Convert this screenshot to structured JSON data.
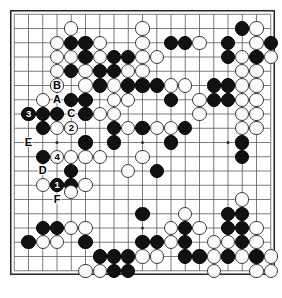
{
  "figure": {
    "kind": "go-board-diagram",
    "board_size": 19,
    "background_color": "#ffffff",
    "line_color": "#5a5a5a",
    "border_color": "#2b2b2b",
    "black_color": "#111111",
    "white_color": "#fbfbfb",
    "geometry": {
      "origin_x": 14.25,
      "origin_y": 14.25,
      "spacing": 14.25,
      "stone_diameter": 14.2
    },
    "star_points": [
      [
        3,
        3
      ],
      [
        9,
        3
      ],
      [
        15,
        3
      ],
      [
        3,
        9
      ],
      [
        9,
        9
      ],
      [
        15,
        9
      ],
      [
        3,
        15
      ],
      [
        9,
        15
      ],
      [
        15,
        15
      ]
    ]
  },
  "stones": {
    "black": [
      [
        4,
        2
      ],
      [
        5,
        2
      ],
      [
        5,
        3
      ],
      [
        7,
        3
      ],
      [
        8,
        3
      ],
      [
        4,
        4
      ],
      [
        6,
        4
      ],
      [
        7,
        4
      ],
      [
        11,
        2
      ],
      [
        12,
        2
      ],
      [
        16,
        1
      ],
      [
        15,
        2
      ],
      [
        18,
        2
      ],
      [
        15,
        3
      ],
      [
        17,
        3
      ],
      [
        6,
        5
      ],
      [
        8,
        5
      ],
      [
        9,
        5
      ],
      [
        10,
        5
      ],
      [
        14,
        5
      ],
      [
        15,
        5
      ],
      [
        4,
        6
      ],
      [
        5,
        6
      ],
      [
        11,
        6
      ],
      [
        14,
        6
      ],
      [
        15,
        6
      ],
      [
        2,
        7
      ],
      [
        3,
        7
      ],
      [
        5,
        7
      ],
      [
        2,
        8
      ],
      [
        7,
        8
      ],
      [
        9,
        8
      ],
      [
        12,
        8
      ],
      [
        5,
        9
      ],
      [
        7,
        9
      ],
      [
        11,
        9
      ],
      [
        16,
        9
      ],
      [
        2,
        10
      ],
      [
        16,
        10
      ],
      [
        4,
        11
      ],
      [
        10,
        11
      ],
      [
        4,
        12
      ],
      [
        9,
        14
      ],
      [
        15,
        14
      ],
      [
        16,
        14
      ],
      [
        2,
        15
      ],
      [
        3,
        15
      ],
      [
        12,
        15
      ],
      [
        15,
        15
      ],
      [
        16,
        15
      ],
      [
        1,
        16
      ],
      [
        5,
        16
      ],
      [
        9,
        16
      ],
      [
        10,
        16
      ],
      [
        12,
        16
      ],
      [
        16,
        16
      ],
      [
        6,
        17
      ],
      [
        7,
        17
      ],
      [
        8,
        17
      ],
      [
        12,
        17
      ],
      [
        13,
        17
      ],
      [
        15,
        17
      ],
      [
        17,
        17
      ],
      [
        7,
        18
      ],
      [
        8,
        18
      ]
    ],
    "white": [
      [
        4,
        1
      ],
      [
        9,
        1
      ],
      [
        17,
        1
      ],
      [
        3,
        2
      ],
      [
        6,
        2
      ],
      [
        9,
        2
      ],
      [
        13,
        2
      ],
      [
        17,
        2
      ],
      [
        3,
        3
      ],
      [
        4,
        3
      ],
      [
        6,
        3
      ],
      [
        9,
        3
      ],
      [
        10,
        3
      ],
      [
        16,
        3
      ],
      [
        18,
        3
      ],
      [
        3,
        4
      ],
      [
        5,
        4
      ],
      [
        8,
        4
      ],
      [
        9,
        4
      ],
      [
        16,
        4
      ],
      [
        17,
        4
      ],
      [
        3,
        5
      ],
      [
        5,
        5
      ],
      [
        7,
        5
      ],
      [
        11,
        5
      ],
      [
        12,
        5
      ],
      [
        16,
        5
      ],
      [
        17,
        5
      ],
      [
        2,
        6
      ],
      [
        7,
        6
      ],
      [
        8,
        6
      ],
      [
        13,
        6
      ],
      [
        16,
        6
      ],
      [
        17,
        6
      ],
      [
        6,
        7
      ],
      [
        7,
        7
      ],
      [
        13,
        7
      ],
      [
        16,
        7
      ],
      [
        17,
        7
      ],
      [
        3,
        8
      ],
      [
        4,
        8
      ],
      [
        8,
        8
      ],
      [
        10,
        8
      ],
      [
        11,
        8
      ],
      [
        16,
        8
      ],
      [
        17,
        8
      ],
      [
        4,
        10
      ],
      [
        5,
        10
      ],
      [
        6,
        10
      ],
      [
        9,
        10
      ],
      [
        8,
        11
      ],
      [
        2,
        12
      ],
      [
        4,
        12.5
      ],
      [
        3,
        12
      ],
      [
        5,
        12
      ],
      [
        5,
        15
      ],
      [
        12,
        14
      ],
      [
        16,
        13
      ],
      [
        4,
        15
      ],
      [
        11,
        15
      ],
      [
        13,
        15
      ],
      [
        17,
        15
      ],
      [
        2,
        16
      ],
      [
        3,
        16
      ],
      [
        11,
        16
      ],
      [
        14,
        16
      ],
      [
        15,
        16
      ],
      [
        17,
        16
      ],
      [
        9,
        17
      ],
      [
        10,
        17
      ],
      [
        14,
        17
      ],
      [
        16,
        17
      ],
      [
        18,
        17
      ],
      [
        5,
        18
      ],
      [
        6,
        18
      ],
      [
        14,
        18
      ],
      [
        17,
        18
      ],
      [
        18,
        18
      ]
    ]
  },
  "marked_stones": [
    {
      "label": "3",
      "color": "black",
      "col": 1,
      "row": 7
    },
    {
      "label": "2",
      "color": "white",
      "col": 4,
      "row": 8
    },
    {
      "label": "4",
      "color": "white",
      "col": 3,
      "row": 10
    },
    {
      "label": "1",
      "color": "black",
      "col": 3,
      "row": 12
    }
  ],
  "board_labels": [
    {
      "label": "B",
      "col": 3,
      "row": 5
    },
    {
      "label": "A",
      "col": 3,
      "row": 6
    },
    {
      "label": "C",
      "col": 4,
      "row": 7
    },
    {
      "label": "E",
      "col": 1,
      "row": 9
    },
    {
      "label": "D",
      "col": 2,
      "row": 11
    },
    {
      "label": "F",
      "col": 3,
      "row": 13
    }
  ]
}
